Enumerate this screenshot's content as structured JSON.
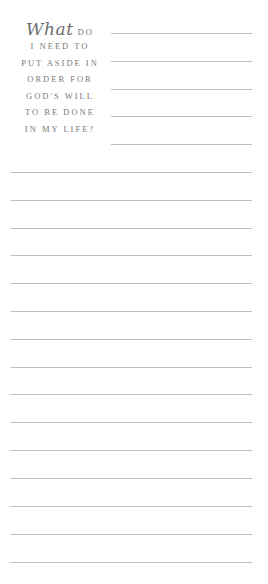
{
  "prompt": {
    "script_word": "What",
    "lines": [
      "DO",
      "I NEED TO",
      "PUT ASIDE IN",
      "ORDER FOR",
      "GOD'S WILL",
      "TO BE DONE",
      "IN MY LIFE?"
    ]
  },
  "colors": {
    "text": "#7a7a7a",
    "rule": "#bdbdbd",
    "background": "#ffffff"
  },
  "writing_area": {
    "short_rule_count": 5,
    "full_rule_count": 15
  }
}
